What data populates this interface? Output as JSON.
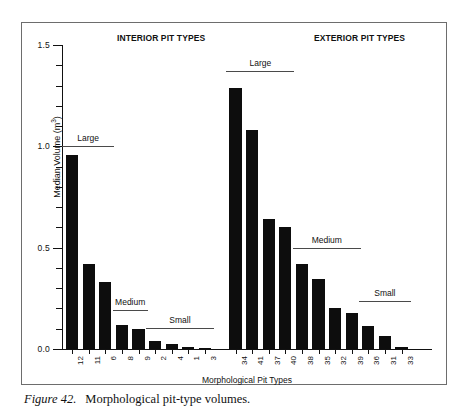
{
  "caption": {
    "figure_number": "Figure 42.",
    "text": "Morphological pit-type volumes."
  },
  "chart_data": {
    "type": "bar",
    "title": "",
    "xlabel": "Morphological Pit Types",
    "ylabel": "Median Volume (m3)",
    "ylabel_base": "Median Volume (m",
    "ylabel_exp": "3",
    "ylabel_close": ")",
    "ylim": [
      0.0,
      1.5
    ],
    "ytick_labels": [
      "0.0",
      "0.5",
      "1.0",
      "1.5"
    ],
    "ytick_values": [
      0.0,
      0.5,
      1.0,
      1.5
    ],
    "minor_tick_step": 0.1,
    "grid": false,
    "legend": "none",
    "bar_color": "#0d0d0d",
    "categories": [
      "12",
      "11",
      "6",
      "8",
      "9",
      "2",
      "4",
      "1",
      "3",
      "34",
      "41",
      "37",
      "40",
      "38",
      "35",
      "32",
      "39",
      "36",
      "31",
      "33"
    ],
    "values": [
      0.955,
      0.42,
      0.33,
      0.12,
      0.1,
      0.04,
      0.025,
      0.012,
      0.007,
      1.29,
      1.08,
      0.64,
      0.6,
      0.42,
      0.345,
      0.2,
      0.18,
      0.115,
      0.065,
      0.012
    ],
    "sections": [
      {
        "name": "INTERIOR PIT TYPES",
        "categories": [
          "12",
          "11",
          "6",
          "8",
          "9",
          "2",
          "4",
          "1",
          "3"
        ]
      },
      {
        "name": "EXTERIOR PIT TYPES",
        "categories": [
          "34",
          "41",
          "37",
          "40",
          "38",
          "35",
          "32",
          "39",
          "36",
          "31",
          "33"
        ]
      }
    ],
    "annotations": [
      {
        "label": "Large",
        "section": "interior",
        "spans": [
          "12",
          "11",
          "6"
        ],
        "level": 1.0
      },
      {
        "label": "Medium",
        "section": "interior",
        "spans": [
          "8",
          "9"
        ],
        "level": 0.19
      },
      {
        "label": "Small",
        "section": "interior",
        "spans": [
          "2",
          "4",
          "1",
          "3"
        ],
        "level": 0.105
      },
      {
        "label": "Large",
        "section": "exterior",
        "spans": [
          "34",
          "41",
          "37",
          "40"
        ],
        "level": 1.37
      },
      {
        "label": "Medium",
        "section": "exterior",
        "spans": [
          "38",
          "35",
          "32",
          "39"
        ],
        "level": 0.5
      },
      {
        "label": "Small",
        "section": "exterior",
        "spans": [
          "36",
          "31",
          "33"
        ],
        "level": 0.235
      }
    ]
  }
}
